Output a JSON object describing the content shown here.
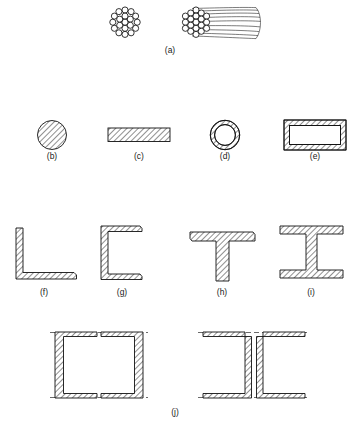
{
  "figure": {
    "background_color": "#ffffff",
    "line_color": "#111111",
    "hatch_color": "#333333",
    "dash_color": "#444444",
    "width": 359,
    "height": 429
  },
  "captions": {
    "a": "(a)",
    "b": "(b)",
    "c": "(c)",
    "d": "(d)",
    "e": "(e)",
    "f": "(f)",
    "g": "(g)",
    "h": "(h)",
    "i": "(i)",
    "j": "(j)"
  },
  "items": [
    {
      "key": "a",
      "label": "(a)",
      "name": "stranded-cable",
      "description": "Wire rope / stranded cable: hexagonally packed round wires shown in cross section and in pictorial view",
      "strand_count": 19,
      "views": [
        "cross-section",
        "pictorial"
      ],
      "row": 1
    },
    {
      "key": "b",
      "label": "(b)",
      "name": "round-bar",
      "description": "Solid round bar, hatched section",
      "row": 2
    },
    {
      "key": "c",
      "label": "(c)",
      "name": "flat-bar",
      "description": "Solid rectangular flat bar / plate, hatched section",
      "row": 2
    },
    {
      "key": "d",
      "label": "(d)",
      "name": "round-tube",
      "description": "Hollow circular tube, annular hatched wall",
      "row": 2
    },
    {
      "key": "e",
      "label": "(e)",
      "name": "rectangular-tube",
      "description": "Hollow rectangular tube, hatched wall",
      "row": 2
    },
    {
      "key": "f",
      "label": "(f)",
      "name": "angle-section",
      "description": "Single angle (L shape) with tapered flanges",
      "row": 3
    },
    {
      "key": "g",
      "label": "(g)",
      "name": "channel-section",
      "description": "Channel (C shape) with tapered flanges",
      "row": 3
    },
    {
      "key": "h",
      "label": "(h)",
      "name": "tee-section",
      "description": "Structural tee (T shape)",
      "row": 3
    },
    {
      "key": "i",
      "label": "(i)",
      "name": "i-beam-section",
      "description": "Wide flange / I beam section",
      "row": 3
    },
    {
      "key": "j",
      "label": "(j)",
      "name": "built-up-channel-sections",
      "description": "Built-up members from two channels: toe-to-toe box with lacing plates, and back-to-back channels with lacing plates",
      "sub_views": [
        "two channels facing each other forming a box, dashed cover plates top and bottom",
        "two channels back to back, dashed cover plates top and bottom"
      ],
      "row": 4
    }
  ]
}
